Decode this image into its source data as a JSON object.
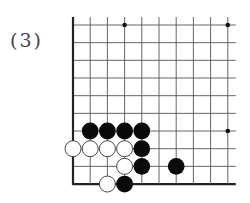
{
  "problem_label": "(3)",
  "board": {
    "columns": 10,
    "rows": 10,
    "origin": [
      73,
      25
    ],
    "spacing": [
      17.2,
      17.67
    ],
    "extend": {
      "top": 8,
      "right": 8
    },
    "edges": [
      "left",
      "bottom"
    ],
    "line_color": "#555555",
    "edge_color": "#222222",
    "star_points": [
      [
        3,
        0
      ],
      [
        9,
        0
      ],
      [
        9,
        6
      ]
    ],
    "stones": [
      {
        "color": "black",
        "col": 1,
        "row": 6
      },
      {
        "color": "black",
        "col": 2,
        "row": 6
      },
      {
        "color": "black",
        "col": 3,
        "row": 6
      },
      {
        "color": "black",
        "col": 4,
        "row": 6
      },
      {
        "color": "white",
        "col": 0,
        "row": 7
      },
      {
        "color": "white",
        "col": 1,
        "row": 7
      },
      {
        "color": "white",
        "col": 2,
        "row": 7
      },
      {
        "color": "white",
        "col": 3,
        "row": 7
      },
      {
        "color": "black",
        "col": 4,
        "row": 7
      },
      {
        "color": "white",
        "col": 3,
        "row": 8
      },
      {
        "color": "black",
        "col": 4,
        "row": 8
      },
      {
        "color": "black",
        "col": 6,
        "row": 8
      },
      {
        "color": "white",
        "col": 2,
        "row": 9
      },
      {
        "color": "black",
        "col": 3,
        "row": 9
      }
    ]
  }
}
